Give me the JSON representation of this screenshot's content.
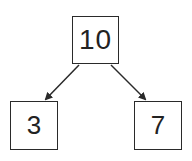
{
  "diagram": {
    "type": "tree",
    "nodes": [
      {
        "id": "root",
        "label": "10"
      },
      {
        "id": "left",
        "label": "3"
      },
      {
        "id": "right",
        "label": "7"
      }
    ],
    "edges": [
      {
        "from": "root",
        "to": "left"
      },
      {
        "from": "root",
        "to": "right"
      }
    ],
    "colors": {
      "stroke": "#2a2a2a",
      "background": "#ffffff"
    }
  }
}
